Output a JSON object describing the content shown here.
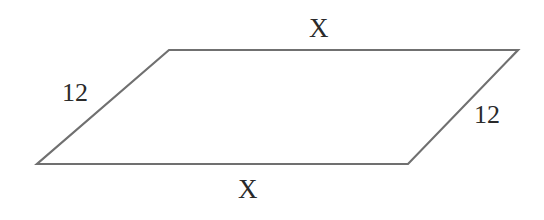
{
  "diagram": {
    "shape": "parallelogram",
    "stroke_color": "#707070",
    "vertices": {
      "top_left": [
        169,
        50
      ],
      "top_right": [
        518,
        50
      ],
      "bottom_right": [
        408,
        164
      ],
      "bottom_left": [
        37,
        164
      ]
    },
    "labels": {
      "top_side": "X",
      "left_side": "12",
      "right_side": "12",
      "bottom_side": "X"
    }
  }
}
